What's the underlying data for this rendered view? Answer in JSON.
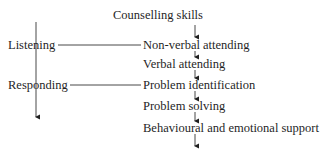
{
  "diagram": {
    "title": "Counselling skills",
    "sequence": [
      {
        "label": "Non-verbal attending"
      },
      {
        "label": "Verbal attending"
      },
      {
        "label": "Problem identification"
      },
      {
        "label": "Problem solving"
      },
      {
        "label": "Behavioural and emotional support"
      }
    ],
    "side_stages": [
      {
        "label": "Listening",
        "links_to": "Non-verbal attending"
      },
      {
        "label": "Responding",
        "links_to": "Problem identification"
      }
    ],
    "colors": {
      "ink": "#1f1f1f",
      "background": "#ffffff"
    }
  }
}
